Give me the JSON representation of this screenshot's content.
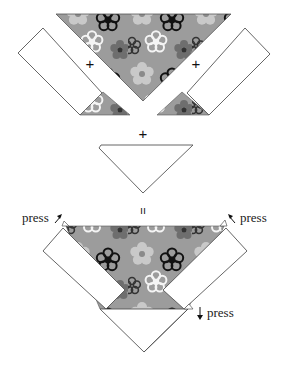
{
  "diagram": {
    "colors": {
      "fabric_base": "#9c9c9c",
      "fabric_light": "#c9c9c9",
      "fabric_dark": "#6e6e6e",
      "fabric_black": "#111111",
      "fabric_white": "#f4f4f4",
      "outline": "#555555",
      "strip_fill": "#ffffff"
    },
    "operators": {
      "plus_left": "+",
      "plus_right": "+",
      "plus_middle": "+",
      "equals": "="
    },
    "labels": {
      "press_top_left": "press",
      "press_top_right": "press",
      "press_bottom": "press"
    },
    "arrows": {
      "press_top_left": "arrow-up-right",
      "press_top_right": "arrow-up-left",
      "press_bottom": "arrow-down"
    }
  }
}
